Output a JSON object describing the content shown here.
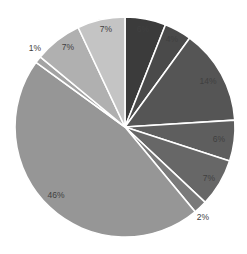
{
  "chart_data": {
    "type": "pie",
    "title": "",
    "start_angle": "12 o'clock, clockwise",
    "labels": [
      "6%",
      "4%",
      "14%",
      "6%",
      "7%",
      "2%",
      "46%",
      "1%",
      "7%",
      "7%"
    ],
    "values": [
      6,
      4,
      14,
      6,
      7,
      2,
      46,
      1,
      7,
      7
    ],
    "colors": [
      "#3b3b3b",
      "#4a4a4a",
      "#555555",
      "#5e5e5e",
      "#676767",
      "#7a7a7a",
      "#969696",
      "#a3a3a3",
      "#b0b0b0",
      "#c4c4c4"
    ],
    "label_positions": [
      {
        "x": 143,
        "y": 30
      },
      {
        "x": 172,
        "y": 40
      },
      {
        "x": 208,
        "y": 82
      },
      {
        "x": 219,
        "y": 140
      },
      {
        "x": 209,
        "y": 179
      },
      {
        "x": 203,
        "y": 218
      },
      {
        "x": 56,
        "y": 196
      },
      {
        "x": 35,
        "y": 49
      },
      {
        "x": 68,
        "y": 48
      },
      {
        "x": 106,
        "y": 30
      }
    ],
    "legend": "none",
    "center": [
      125,
      127
    ],
    "radius": 110
  }
}
